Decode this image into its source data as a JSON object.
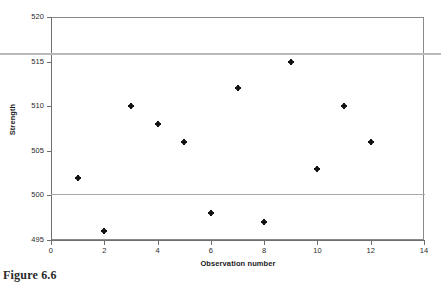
{
  "caption": "Figure 6.6",
  "chart_data": {
    "type": "scatter",
    "title": "",
    "xlabel": "Observation number",
    "ylabel": "Strength",
    "x": [
      1,
      2,
      3,
      4,
      5,
      6,
      7,
      8,
      9,
      10,
      11,
      12
    ],
    "values": [
      502,
      496,
      510,
      508,
      506,
      498,
      512,
      497,
      515,
      503,
      510,
      506
    ],
    "series": [
      {
        "name": "Strength",
        "x": [
          1,
          2,
          3,
          4,
          5,
          6,
          7,
          8,
          9,
          10,
          11,
          12
        ],
        "values": [
          502,
          496,
          510,
          508,
          506,
          498,
          512,
          497,
          515,
          503,
          510,
          506
        ]
      }
    ],
    "xlim": [
      0,
      14
    ],
    "ylim": [
      495,
      520
    ],
    "xticks": [
      "0",
      "2",
      "4",
      "6",
      "8",
      "10",
      "12",
      "14"
    ],
    "xtick_values": [
      0,
      2,
      4,
      6,
      8,
      10,
      12,
      14
    ],
    "yticks": [
      "495",
      "500",
      "505",
      "510",
      "515",
      "520"
    ],
    "ytick_values": [
      495,
      500,
      505,
      510,
      515,
      520
    ],
    "grid": false,
    "legend": "none",
    "reference_lines": [
      {
        "name": "upper-limit-line",
        "value": 515.8,
        "color": "#b9b9b9",
        "extent": "full-width"
      },
      {
        "name": "lower-limit-line",
        "value": 500,
        "color": "#a9a9a9",
        "extent": "plot-width"
      }
    ],
    "marker": {
      "shape": "plus-dot",
      "color": "#111111",
      "size": 4
    },
    "frame_color": "#8a8a8a",
    "background": "#ffffff"
  }
}
